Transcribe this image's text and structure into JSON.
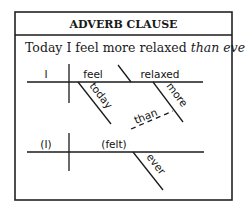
{
  "panel": {
    "title": "ADVERB CLAUSE",
    "sentence": {
      "plain": "Today I feel more relaxed ",
      "italic": "than ever."
    }
  },
  "diagram": {
    "main_clause": {
      "subject": "I",
      "verb": "feel",
      "complement": "relaxed",
      "modifiers": {
        "verb_modifier": "today",
        "complement_modifier": "more"
      }
    },
    "connector": "than",
    "subordinate_clause": {
      "subject": "(I)",
      "verb": "(felt)",
      "modifiers": {
        "verb_modifier": "ever"
      }
    }
  }
}
